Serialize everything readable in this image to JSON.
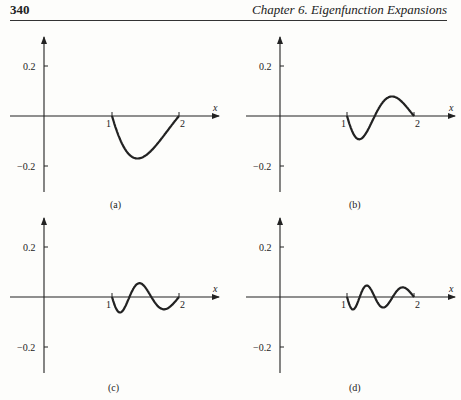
{
  "header": {
    "page_number": "340",
    "chapter_title": "Chapter 6. Eigenfunction Expansions"
  },
  "chart_data": [
    {
      "type": "line",
      "panel": "(a)",
      "xlabel": "x",
      "ylabel": "",
      "x_ticks": [
        "1",
        "2"
      ],
      "y_ticks": [
        "0.2",
        "-0.2"
      ],
      "ylim": [
        -0.3,
        0.3
      ],
      "grid": false,
      "n": 1,
      "x": [
        1.0,
        1.125,
        1.25,
        1.375,
        1.5,
        1.625,
        1.75,
        1.875,
        2.0
      ],
      "values": [
        0.0,
        -0.08,
        -0.14,
        -0.165,
        -0.17,
        -0.16,
        -0.13,
        -0.075,
        0.0
      ]
    },
    {
      "type": "line",
      "panel": "(b)",
      "xlabel": "x",
      "ylabel": "",
      "x_ticks": [
        "1",
        "2"
      ],
      "y_ticks": [
        "0.2",
        "-0.2"
      ],
      "ylim": [
        -0.3,
        0.3
      ],
      "grid": false,
      "n": 2,
      "x": [
        1.0,
        1.125,
        1.25,
        1.375,
        1.5,
        1.625,
        1.75,
        1.875,
        2.0
      ],
      "values": [
        0.0,
        -0.07,
        -0.09,
        -0.05,
        0.01,
        0.06,
        0.08,
        0.055,
        0.0
      ]
    },
    {
      "type": "line",
      "panel": "(c)",
      "xlabel": "x",
      "ylabel": "",
      "x_ticks": [
        "1",
        "2"
      ],
      "y_ticks": [
        "0.2",
        "-0.2"
      ],
      "ylim": [
        -0.3,
        0.3
      ],
      "grid": false,
      "n": 3,
      "x": [
        1.0,
        1.125,
        1.25,
        1.375,
        1.5,
        1.625,
        1.75,
        1.875,
        2.0
      ],
      "values": [
        0.0,
        -0.06,
        -0.02,
        0.045,
        0.055,
        0.0,
        -0.05,
        -0.04,
        0.0
      ]
    },
    {
      "type": "line",
      "panel": "(d)",
      "xlabel": "x",
      "ylabel": "",
      "x_ticks": [
        "1",
        "2"
      ],
      "y_ticks": [
        "0.2",
        "-0.2"
      ],
      "ylim": [
        -0.3,
        0.3
      ],
      "grid": false,
      "n": 4,
      "x": [
        1.0,
        1.125,
        1.25,
        1.375,
        1.5,
        1.625,
        1.75,
        1.875,
        2.0
      ],
      "values": [
        0.0,
        -0.05,
        0.02,
        0.045,
        -0.03,
        -0.04,
        0.03,
        0.035,
        0.0
      ]
    }
  ],
  "captions": [
    "(a)",
    "(b)",
    "(c)",
    "(d)"
  ],
  "axis": {
    "x_label": "x",
    "tick_1": "1",
    "tick_2": "2",
    "y_tick_pos": "0.2",
    "y_tick_neg": "−0.2"
  }
}
